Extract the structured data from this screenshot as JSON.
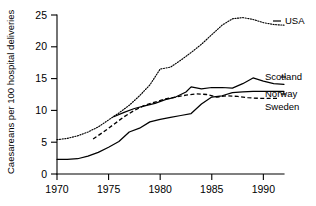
{
  "chart_data": {
    "type": "line",
    "title": "",
    "xlabel": "",
    "ylabel": "Caesareans per 100 hospital deliveries",
    "xlim": [
      1970,
      1992
    ],
    "ylim": [
      0,
      25
    ],
    "grid": false,
    "legend_position": "right-inline-labels",
    "xticks": [
      "1970",
      "1975",
      "1980",
      "1985",
      "1990"
    ],
    "xtick_values": [
      1970,
      1975,
      1980,
      1985,
      1990
    ],
    "yticks": [
      "0",
      "5",
      "10",
      "15",
      "20",
      "25"
    ],
    "ytick_values": [
      0,
      5,
      10,
      15,
      20,
      25
    ],
    "series": [
      {
        "name": "USA",
        "style": "dotted",
        "color": "#000000",
        "x": [
          1970,
          1971,
          1972,
          1973,
          1974,
          1975,
          1976,
          1977,
          1978,
          1979,
          1980,
          1981,
          1982,
          1983,
          1984,
          1985,
          1986,
          1987,
          1988,
          1989,
          1990,
          1991,
          1992
        ],
        "values": [
          5.4,
          5.6,
          6.0,
          6.6,
          7.4,
          8.5,
          9.6,
          10.8,
          12.3,
          14.0,
          16.5,
          16.8,
          17.9,
          19.1,
          20.4,
          21.9,
          23.4,
          24.4,
          24.6,
          24.3,
          23.8,
          23.5,
          23.4
        ]
      },
      {
        "name": "Scotland",
        "style": "solid",
        "color": "#000000",
        "x": [
          1975.5,
          1976.5,
          1977.5,
          1978.5,
          1979.5,
          1980.5,
          1981.5,
          1982.5,
          1983,
          1984,
          1985,
          1986,
          1987,
          1988,
          1989,
          1990,
          1991,
          1992
        ],
        "values": [
          9.0,
          9.7,
          10.3,
          10.7,
          11.1,
          11.7,
          12.1,
          12.9,
          13.7,
          13.4,
          13.6,
          13.6,
          13.5,
          14.2,
          15.1,
          14.6,
          14.2,
          14.1
        ]
      },
      {
        "name": "Norway",
        "style": "solid",
        "color": "#000000",
        "x": [
          1970,
          1971,
          1972,
          1973,
          1974,
          1975,
          1976,
          1977,
          1978,
          1979,
          1980,
          1981,
          1982,
          1983,
          1984,
          1985,
          1986,
          1987,
          1988,
          1989,
          1990,
          1991,
          1992
        ],
        "values": [
          2.3,
          2.3,
          2.4,
          2.8,
          3.4,
          4.2,
          5.1,
          6.6,
          7.2,
          8.2,
          8.6,
          8.9,
          9.2,
          9.5,
          11.0,
          12.1,
          12.3,
          12.8,
          12.9,
          13.0,
          13.0,
          13.0,
          13.0
        ]
      },
      {
        "name": "Sweden",
        "style": "dashed",
        "color": "#000000",
        "x": [
          1973.5,
          1974.5,
          1975.5,
          1976.5,
          1977.5,
          1978.5,
          1979.5,
          1980.5,
          1981.5,
          1982.5,
          1983.5,
          1984.5,
          1985.5,
          1986.5,
          1987.5,
          1988.5,
          1989.5,
          1990.5,
          1991.5
        ],
        "values": [
          5.5,
          6.6,
          7.8,
          9.0,
          10.0,
          10.8,
          11.3,
          11.8,
          12.1,
          12.4,
          12.6,
          12.5,
          12.1,
          12.3,
          12.2,
          12.0,
          11.9,
          11.9,
          11.9
        ]
      }
    ]
  },
  "axes": {
    "y_title": "Caesareans per 100 hospital deliveries"
  },
  "labels": {
    "usa": "USA",
    "scotland": "Scotland",
    "norway": "Norway",
    "sweden": "Sweden"
  }
}
